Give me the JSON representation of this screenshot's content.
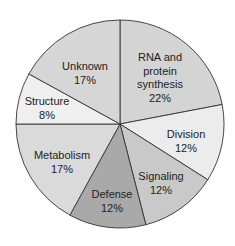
{
  "chart_data": {
    "type": "pie",
    "title": "",
    "start_angle_deg": 0,
    "direction": "clockwise",
    "slices": [
      {
        "label": "RNA and protein synthesis",
        "value": 22,
        "display": "22%",
        "color": "#d4d4d4",
        "label_lines": [
          "RNA and",
          "protein",
          "synthesis",
          "22%"
        ],
        "label_pos": [
          160,
          78
        ]
      },
      {
        "label": "Division",
        "value": 12,
        "display": "12%",
        "color": "#ececec",
        "label_lines": [
          "Division",
          "12%"
        ],
        "label_pos": [
          186,
          141
        ]
      },
      {
        "label": "Signaling",
        "value": 12,
        "display": "12%",
        "color": "#c9c9c9",
        "label_lines": [
          "Signaling",
          "12%"
        ],
        "label_pos": [
          161,
          183
        ]
      },
      {
        "label": "Defense",
        "value": 12,
        "display": "12%",
        "color": "#a9a9a9",
        "label_lines": [
          "Defense",
          "12%"
        ],
        "label_pos": [
          112,
          201
        ]
      },
      {
        "label": "Metabolism",
        "value": 17,
        "display": "17%",
        "color": "#dadada",
        "label_lines": [
          "Metabolism",
          "17%"
        ],
        "label_pos": [
          62,
          162
        ]
      },
      {
        "label": "Structure",
        "value": 8,
        "display": "8%",
        "color": "#efefef",
        "label_lines": [
          "Structure",
          "8%"
        ],
        "label_pos": [
          47,
          108
        ]
      },
      {
        "label": "Unknown",
        "value": 17,
        "display": "17%",
        "color": "#d6d6d6",
        "label_lines": [
          "Unknown",
          "17%"
        ],
        "label_pos": [
          85,
          73
        ]
      }
    ],
    "legend": "none",
    "center": [
      120,
      124
    ],
    "radius": 104
  }
}
